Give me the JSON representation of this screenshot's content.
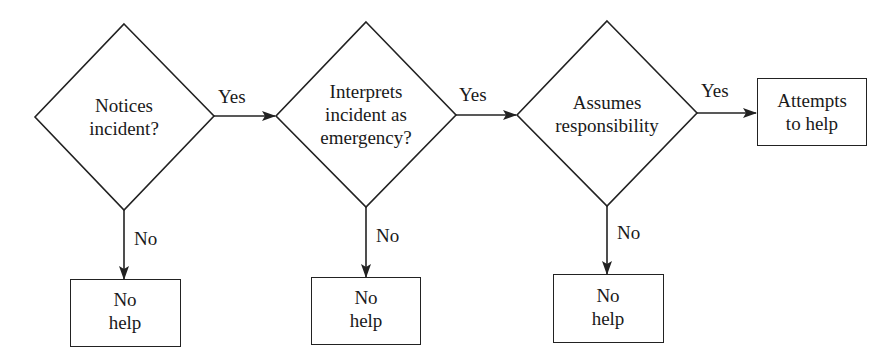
{
  "diagram": {
    "type": "flowchart",
    "decisions": [
      {
        "id": "d1",
        "lines": [
          "Notices",
          "incident?"
        ]
      },
      {
        "id": "d2",
        "lines": [
          "Interprets",
          "incident as",
          "emergency?"
        ]
      },
      {
        "id": "d3",
        "lines": [
          "Assumes",
          "responsibility"
        ]
      }
    ],
    "outcomes": {
      "success": {
        "lines": [
          "Attempts",
          "to help"
        ]
      },
      "failures": [
        {
          "lines": [
            "No",
            "help"
          ]
        },
        {
          "lines": [
            "No",
            "help"
          ]
        },
        {
          "lines": [
            "No",
            "help"
          ]
        }
      ]
    },
    "edges": [
      {
        "from": "d1",
        "to": "d2",
        "label": "Yes"
      },
      {
        "from": "d2",
        "to": "d3",
        "label": "Yes"
      },
      {
        "from": "d3",
        "to": "success",
        "label": "Yes"
      },
      {
        "from": "d1",
        "to": "fail1",
        "label": "No"
      },
      {
        "from": "d2",
        "to": "fail2",
        "label": "No"
      },
      {
        "from": "d3",
        "to": "fail3",
        "label": "No"
      }
    ],
    "colors": {
      "stroke": "#222222",
      "background": "#ffffff"
    }
  }
}
